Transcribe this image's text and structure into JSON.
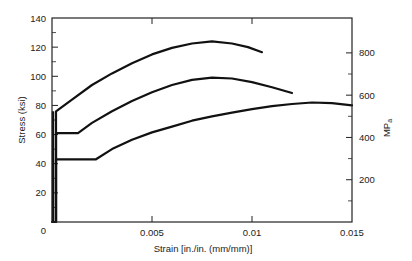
{
  "chart_data": {
    "type": "line",
    "title": "",
    "xlabel": "Strain [in./in. (mm/mm)]",
    "ylabel": "Stress (ksi)",
    "y2label": "MPa",
    "xlim": [
      0,
      0.015
    ],
    "ylim": [
      0,
      140
    ],
    "y2lim": [
      0,
      965
    ],
    "grid": false,
    "legend": null,
    "x_ticks": [
      0,
      0.005,
      0.01,
      0.015
    ],
    "x_tick_labels": [
      "0",
      "0.005",
      "0.01",
      "0.015"
    ],
    "y_ticks": [
      0,
      20,
      40,
      60,
      80,
      100,
      120,
      140
    ],
    "y_tick_labels": [
      "0",
      "20",
      "40",
      "60",
      "80",
      "100",
      "120",
      "140"
    ],
    "y2_ticks": [
      200,
      400,
      600,
      800
    ],
    "y2_tick_labels": [
      "200",
      "400",
      "600",
      "800"
    ],
    "series": [
      {
        "name": "Curve A (highest strength)",
        "points": [
          [
            0,
            0
          ],
          [
            0.0002,
            0
          ],
          [
            0.0002,
            76
          ],
          [
            0.001,
            84
          ],
          [
            0.002,
            94
          ],
          [
            0.003,
            102
          ],
          [
            0.004,
            109
          ],
          [
            0.005,
            115
          ],
          [
            0.006,
            119.5
          ],
          [
            0.007,
            122.5
          ],
          [
            0.008,
            124
          ],
          [
            0.009,
            122.5
          ],
          [
            0.0098,
            120
          ],
          [
            0.0105,
            116.5
          ]
        ]
      },
      {
        "name": "Curve B (intermediate strength)",
        "points": [
          [
            0.0002,
            0
          ],
          [
            0.0002,
            61
          ],
          [
            0.0013,
            61
          ],
          [
            0.002,
            68
          ],
          [
            0.003,
            76
          ],
          [
            0.004,
            83
          ],
          [
            0.005,
            89
          ],
          [
            0.006,
            94
          ],
          [
            0.007,
            97.5
          ],
          [
            0.008,
            99
          ],
          [
            0.009,
            98.5
          ],
          [
            0.01,
            96
          ],
          [
            0.011,
            92.5
          ],
          [
            0.012,
            88.5
          ]
        ]
      },
      {
        "name": "Curve C (lowest strength)",
        "points": [
          [
            0.0002,
            0
          ],
          [
            0.0002,
            43
          ],
          [
            0.0022,
            43
          ],
          [
            0.003,
            50
          ],
          [
            0.004,
            56.5
          ],
          [
            0.005,
            61.5
          ],
          [
            0.006,
            65.5
          ],
          [
            0.007,
            69.5
          ],
          [
            0.008,
            72.5
          ],
          [
            0.009,
            75
          ],
          [
            0.01,
            77.5
          ],
          [
            0.011,
            79.5
          ],
          [
            0.012,
            81
          ],
          [
            0.013,
            82
          ],
          [
            0.014,
            81.5
          ],
          [
            0.015,
            80
          ]
        ]
      }
    ]
  },
  "labels": {
    "xlabel": "Strain [in./in. (mm/mm)]",
    "ylabel": "Stress (ksi)",
    "y2label_main": "MP",
    "y2label_sub": "a"
  }
}
